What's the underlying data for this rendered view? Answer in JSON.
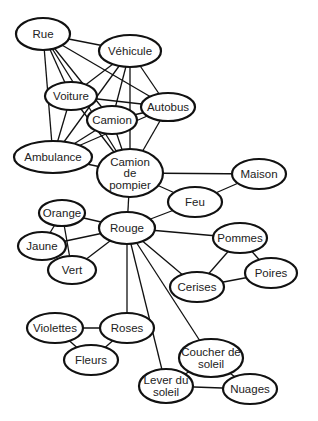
{
  "diagram": {
    "type": "semantic-network",
    "colors": {
      "stroke": "#111111",
      "fill": "#ffffff",
      "text": "#222222"
    },
    "nodes": [
      {
        "id": "rue",
        "label": [
          "Rue"
        ],
        "cx": 43,
        "cy": 34,
        "rx": 27,
        "ry": 16
      },
      {
        "id": "vehicule",
        "label": [
          "Véhicule"
        ],
        "cx": 130,
        "cy": 51,
        "rx": 31,
        "ry": 16
      },
      {
        "id": "voiture",
        "label": [
          "Voiture"
        ],
        "cx": 71,
        "cy": 96,
        "rx": 26,
        "ry": 14
      },
      {
        "id": "autobus",
        "label": [
          "Autobus"
        ],
        "cx": 168,
        "cy": 107,
        "rx": 27,
        "ry": 14
      },
      {
        "id": "camion",
        "label": [
          "Camion"
        ],
        "cx": 112,
        "cy": 120,
        "rx": 25,
        "ry": 14
      },
      {
        "id": "ambulance",
        "label": [
          "Ambulance"
        ],
        "cx": 53,
        "cy": 157,
        "rx": 39,
        "ry": 16
      },
      {
        "id": "camion-de-pompier",
        "label": [
          "Camion",
          "de",
          "pompier"
        ],
        "cx": 130,
        "cy": 173,
        "rx": 33,
        "ry": 24
      },
      {
        "id": "maison",
        "label": [
          "Maison"
        ],
        "cx": 259,
        "cy": 174,
        "rx": 27,
        "ry": 15
      },
      {
        "id": "feu",
        "label": [
          "Feu"
        ],
        "cx": 195,
        "cy": 202,
        "rx": 27,
        "ry": 15
      },
      {
        "id": "orange",
        "label": [
          "Orange"
        ],
        "cx": 62,
        "cy": 213,
        "rx": 23,
        "ry": 13
      },
      {
        "id": "rouge",
        "label": [
          "Rouge"
        ],
        "cx": 127,
        "cy": 228,
        "rx": 28,
        "ry": 16
      },
      {
        "id": "jaune",
        "label": [
          "Jaune"
        ],
        "cx": 42,
        "cy": 246,
        "rx": 24,
        "ry": 14
      },
      {
        "id": "vert",
        "label": [
          "Vert"
        ],
        "cx": 72,
        "cy": 270,
        "rx": 24,
        "ry": 14
      },
      {
        "id": "pommes",
        "label": [
          "Pommes"
        ],
        "cx": 240,
        "cy": 238,
        "rx": 27,
        "ry": 15
      },
      {
        "id": "poires",
        "label": [
          "Poires"
        ],
        "cx": 271,
        "cy": 273,
        "rx": 26,
        "ry": 15
      },
      {
        "id": "cerises",
        "label": [
          "Cerises"
        ],
        "cx": 197,
        "cy": 287,
        "rx": 27,
        "ry": 15
      },
      {
        "id": "violettes",
        "label": [
          "Violettes"
        ],
        "cx": 55,
        "cy": 328,
        "rx": 28,
        "ry": 15
      },
      {
        "id": "roses",
        "label": [
          "Roses"
        ],
        "cx": 127,
        "cy": 328,
        "rx": 27,
        "ry": 15
      },
      {
        "id": "fleurs",
        "label": [
          "Fleurs"
        ],
        "cx": 91,
        "cy": 360,
        "rx": 27,
        "ry": 15
      },
      {
        "id": "coucher-de-soleil",
        "label": [
          "Coucher de",
          "soleil"
        ],
        "cx": 211,
        "cy": 358,
        "rx": 32,
        "ry": 19
      },
      {
        "id": "lever-du-soleil",
        "label": [
          "Lever du",
          "soleil"
        ],
        "cx": 166,
        "cy": 386,
        "rx": 27,
        "ry": 17
      },
      {
        "id": "nuages",
        "label": [
          "Nuages"
        ],
        "cx": 250,
        "cy": 389,
        "rx": 27,
        "ry": 15
      }
    ],
    "edges": [
      [
        "rue",
        "vehicule"
      ],
      [
        "rue",
        "voiture"
      ],
      [
        "rue",
        "autobus"
      ],
      [
        "rue",
        "camion"
      ],
      [
        "rue",
        "ambulance"
      ],
      [
        "rue",
        "camion-de-pompier"
      ],
      [
        "vehicule",
        "voiture"
      ],
      [
        "vehicule",
        "autobus"
      ],
      [
        "vehicule",
        "camion"
      ],
      [
        "vehicule",
        "ambulance"
      ],
      [
        "vehicule",
        "camion-de-pompier"
      ],
      [
        "voiture",
        "autobus"
      ],
      [
        "voiture",
        "ambulance"
      ],
      [
        "voiture",
        "camion-de-pompier"
      ],
      [
        "autobus",
        "ambulance"
      ],
      [
        "autobus",
        "camion-de-pompier"
      ],
      [
        "autobus",
        "camion"
      ],
      [
        "camion",
        "ambulance"
      ],
      [
        "camion",
        "camion-de-pompier"
      ],
      [
        "ambulance",
        "camion-de-pompier"
      ],
      [
        "camion-de-pompier",
        "maison"
      ],
      [
        "camion-de-pompier",
        "feu"
      ],
      [
        "camion-de-pompier",
        "rouge"
      ],
      [
        "maison",
        "feu"
      ],
      [
        "feu",
        "rouge"
      ],
      [
        "rouge",
        "orange"
      ],
      [
        "rouge",
        "jaune"
      ],
      [
        "rouge",
        "vert"
      ],
      [
        "orange",
        "jaune"
      ],
      [
        "orange",
        "vert"
      ],
      [
        "jaune",
        "vert"
      ],
      [
        "rouge",
        "pommes"
      ],
      [
        "rouge",
        "cerises"
      ],
      [
        "rouge",
        "roses"
      ],
      [
        "rouge",
        "coucher-de-soleil"
      ],
      [
        "rouge",
        "lever-du-soleil"
      ],
      [
        "pommes",
        "cerises"
      ],
      [
        "pommes",
        "poires"
      ],
      [
        "cerises",
        "poires"
      ],
      [
        "roses",
        "violettes"
      ],
      [
        "roses",
        "fleurs"
      ],
      [
        "violettes",
        "fleurs"
      ],
      [
        "coucher-de-soleil",
        "lever-du-soleil"
      ],
      [
        "coucher-de-soleil",
        "nuages"
      ],
      [
        "lever-du-soleil",
        "nuages"
      ]
    ]
  }
}
